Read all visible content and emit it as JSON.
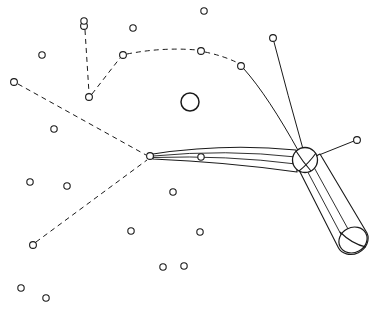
{
  "figure": {
    "width": 373,
    "height": 310,
    "background_color": "#ffffff",
    "line_color": "#1a1a1a",
    "style": "black and white technical line art, no text labels"
  },
  "chart_data": {
    "type": "scatter",
    "xlabel": "",
    "ylabel": "",
    "xlim": [
      0,
      373
    ],
    "ylim": [
      0,
      310
    ],
    "grid": false,
    "legend": "none",
    "coordinate_note": "pixel coordinates, origin top-left, y increases downward",
    "categories": [
      "scatter-node",
      "network-node",
      "junction-sphere",
      "free-circle",
      "tube"
    ],
    "values": [
      22,
      10,
      1,
      1,
      1
    ],
    "series": [
      {
        "name": "scatter-node",
        "description": "small isolated open circles scattered on the field",
        "marker": "open circle",
        "radius": 3.2,
        "points": [
          {
            "x": 204,
            "y": 11
          },
          {
            "x": 133,
            "y": 28
          },
          {
            "x": 84,
            "y": 21
          },
          {
            "x": 42,
            "y": 55
          },
          {
            "x": 54,
            "y": 129
          },
          {
            "x": 30,
            "y": 182
          },
          {
            "x": 67,
            "y": 186
          },
          {
            "x": 173,
            "y": 192
          },
          {
            "x": 201,
            "y": 157
          },
          {
            "x": 200,
            "y": 232
          },
          {
            "x": 131,
            "y": 231
          },
          {
            "x": 163,
            "y": 267
          },
          {
            "x": 184,
            "y": 266
          },
          {
            "x": 21,
            "y": 288
          },
          {
            "x": 46,
            "y": 298
          },
          {
            "x": 85,
            "y": 289
          }
        ]
      },
      {
        "name": "network-node",
        "description": "open circles that are endpoints or vertices of the dashed and solid connector paths",
        "marker": "open circle",
        "radius": 3.4,
        "points": [
          {
            "x": 84,
            "y": 26,
            "role": "dashed-branch-tip-upper"
          },
          {
            "x": 89,
            "y": 97,
            "role": "dashed-vertex-lower"
          },
          {
            "x": 123,
            "y": 55,
            "role": "dashed-arc-vertex"
          },
          {
            "x": 201,
            "y": 51,
            "role": "dashed-arc-apex"
          },
          {
            "x": 241,
            "y": 66,
            "role": "dashed-to-solid-transition"
          },
          {
            "x": 14,
            "y": 82,
            "role": "dashed-branch-tip-left"
          },
          {
            "x": 33,
            "y": 245,
            "role": "dashed-branch-tip-lower-left"
          },
          {
            "x": 150,
            "y": 156,
            "role": "tube-apex-hub"
          },
          {
            "x": 273,
            "y": 38,
            "role": "antenna-tip-upper"
          },
          {
            "x": 357,
            "y": 140,
            "role": "antenna-tip-right"
          }
        ]
      },
      {
        "name": "junction-sphere",
        "description": "shaded sphere where the tube bends and the antenna lines converge",
        "marker": "circle with seam arcs",
        "points": [
          {
            "x": 305,
            "y": 160,
            "radius": 12.5
          }
        ]
      },
      {
        "name": "free-circle",
        "description": "larger standalone open circle near the centre of the field",
        "marker": "open circle",
        "points": [
          {
            "x": 190,
            "y": 102,
            "radius": 9.0
          }
        ]
      },
      {
        "name": "tube",
        "description": "bent tubular bundle: thin tapered segment from hub to sphere, thick cylindrical segment from sphere to capped end",
        "points": [
          {
            "x": 150,
            "y": 156,
            "role": "taper-start"
          },
          {
            "x": 305,
            "y": 160,
            "role": "bend-at-sphere"
          },
          {
            "x": 353,
            "y": 240,
            "role": "capped-end"
          }
        ]
      }
    ],
    "connections": [
      {
        "from": "dashed-branch-tip-upper",
        "to": "dashed-vertex-lower",
        "style": "dashed"
      },
      {
        "from": "dashed-vertex-lower",
        "to": "dashed-arc-vertex",
        "style": "dashed"
      },
      {
        "from": "dashed-arc-vertex",
        "to": "dashed-arc-apex",
        "style": "dashed"
      },
      {
        "from": "dashed-arc-apex",
        "to": "dashed-to-solid-transition",
        "style": "dashed"
      },
      {
        "from": "dashed-to-solid-transition",
        "to": "junction-sphere",
        "style": "solid-curved"
      },
      {
        "from": "dashed-branch-tip-left",
        "to": "tube-apex-hub",
        "style": "dashed"
      },
      {
        "from": "dashed-branch-tip-lower-left",
        "to": "tube-apex-hub",
        "style": "dashed"
      },
      {
        "from": "antenna-tip-upper",
        "to": "junction-sphere",
        "style": "solid-curved"
      },
      {
        "from": "antenna-tip-right",
        "to": "junction-sphere",
        "style": "solid-straight"
      },
      {
        "from": "tube-apex-hub",
        "to": "junction-sphere",
        "style": "tube-taper"
      },
      {
        "from": "junction-sphere",
        "to": "capped-end",
        "style": "tube-cylinder"
      }
    ]
  }
}
